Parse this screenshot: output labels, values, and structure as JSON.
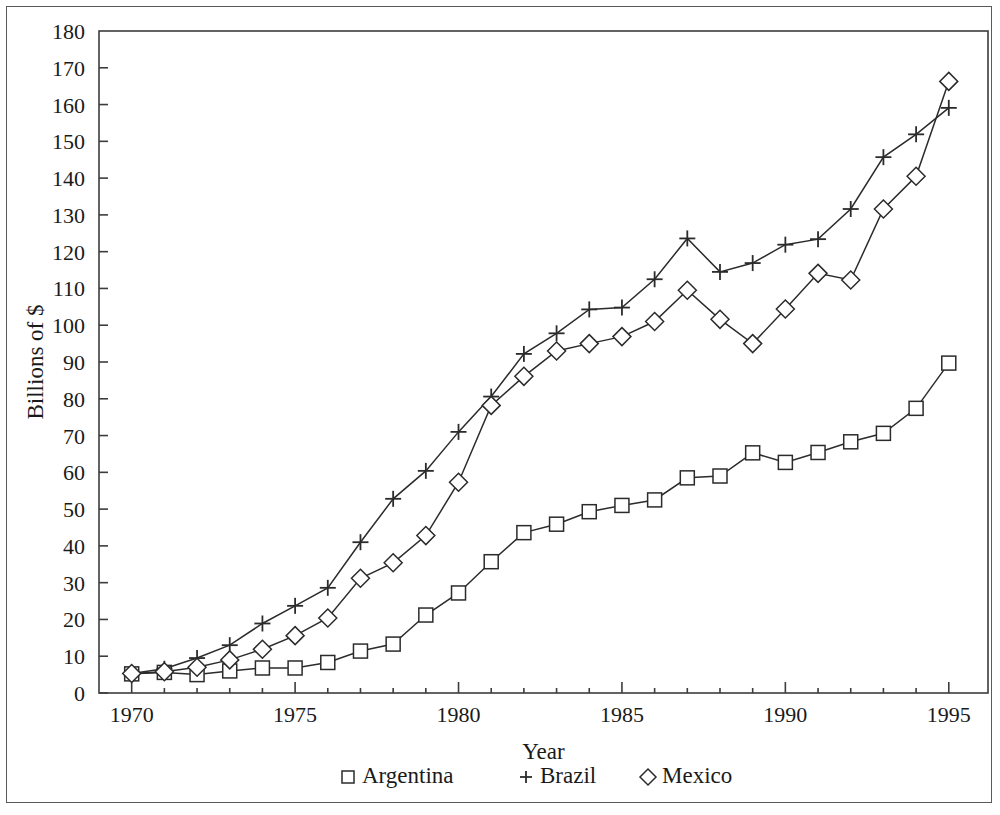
{
  "chart_data": {
    "type": "line",
    "title": "",
    "xlabel": "Year",
    "ylabel": "Billions of $",
    "xlim": [
      1969.0,
      1996.2
    ],
    "ylim": [
      0,
      180
    ],
    "grid": false,
    "legend_position": "bottom",
    "x_ticks": [
      1970,
      1975,
      1980,
      1985,
      1990,
      1995
    ],
    "x_tick_labels": [
      "1970",
      "1975",
      "1980",
      "1985",
      "1990",
      "1995"
    ],
    "x_minor_ticks": [
      1971,
      1972,
      1973,
      1974,
      1976,
      1977,
      1978,
      1979,
      1981,
      1982,
      1983,
      1984,
      1986,
      1987,
      1988,
      1989,
      1991,
      1992,
      1993,
      1994
    ],
    "y_ticks": [
      0,
      10,
      20,
      30,
      40,
      50,
      60,
      70,
      80,
      90,
      100,
      110,
      120,
      130,
      140,
      150,
      160,
      170,
      180
    ],
    "y_tick_labels": [
      "0",
      "10",
      "20",
      "30",
      "40",
      "50",
      "60",
      "70",
      "80",
      "90",
      "100",
      "110",
      "120",
      "130",
      "140",
      "150",
      "160",
      "170",
      "180"
    ],
    "x": [
      1970,
      1971,
      1972,
      1973,
      1974,
      1975,
      1976,
      1977,
      1978,
      1979,
      1980,
      1981,
      1982,
      1983,
      1984,
      1985,
      1986,
      1987,
      1988,
      1989,
      1990,
      1991,
      1992,
      1993,
      1994,
      1995
    ],
    "series": [
      {
        "name": "Argentina",
        "marker": "square",
        "values": [
          5.2,
          5.6,
          5.0,
          6.0,
          6.8,
          6.8,
          8.3,
          11.4,
          13.3,
          21.2,
          27.2,
          35.7,
          43.6,
          45.9,
          49.3,
          51.0,
          52.5,
          58.5,
          59.0,
          65.3,
          62.7,
          65.4,
          68.3,
          70.6,
          77.4,
          89.7
        ]
      },
      {
        "name": "Brazil",
        "marker": "plus",
        "values": [
          5.3,
          6.6,
          9.5,
          13.0,
          18.9,
          23.7,
          28.6,
          41.0,
          52.8,
          60.4,
          71.0,
          80.6,
          92.2,
          97.8,
          104.3,
          104.8,
          112.5,
          123.6,
          114.5,
          116.9,
          121.9,
          123.4,
          131.6,
          145.7,
          151.9,
          159.1
        ]
      },
      {
        "name": "Mexico",
        "marker": "diamond",
        "values": [
          5.3,
          5.8,
          7.0,
          9.0,
          11.9,
          15.6,
          20.4,
          31.2,
          35.4,
          42.8,
          57.3,
          78.2,
          86.1,
          93.0,
          95.0,
          96.9,
          101.0,
          109.5,
          101.6,
          95.0,
          104.4,
          114.1,
          112.3,
          131.6,
          140.5,
          166.3
        ]
      }
    ]
  },
  "legend": {
    "items": [
      {
        "symbol": "□",
        "label": "Argentina"
      },
      {
        "symbol": "+",
        "label": "Brazil"
      },
      {
        "symbol": "◇",
        "label": "Mexico"
      }
    ]
  },
  "colors": {
    "line": "#2b2b2b",
    "axis": "#3c3c3c",
    "text": "#1a1a1a",
    "frame": "#5a5a5a",
    "background": "#ffffff"
  }
}
